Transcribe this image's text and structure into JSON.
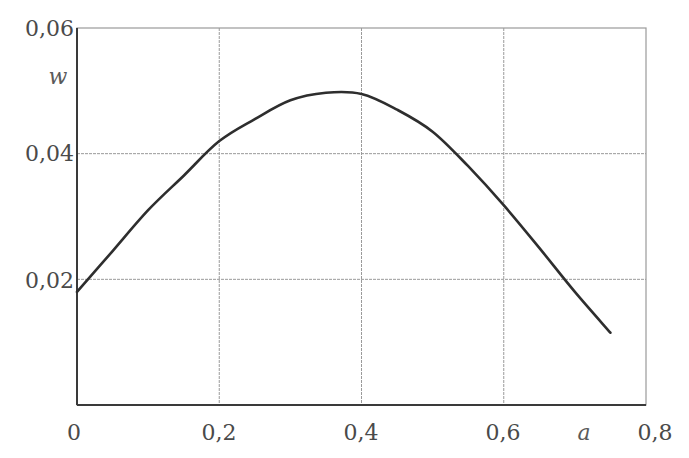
{
  "chart_data": {
    "type": "line",
    "title": "",
    "xlabel": "a",
    "ylabel": "w",
    "xlim": [
      0,
      0.8
    ],
    "ylim": [
      0,
      0.06
    ],
    "grid": true,
    "legend": null,
    "x_ticks": [
      "0",
      "0,2",
      "0,4",
      "0,6",
      "0,8"
    ],
    "x_tick_values": [
      0,
      0.2,
      0.4,
      0.6,
      0.8
    ],
    "y_ticks": [
      "0,02",
      "0,04",
      "0,06"
    ],
    "y_tick_values": [
      0.02,
      0.04,
      0.06
    ],
    "series": [
      {
        "name": "w(a)",
        "x": [
          0,
          0.05,
          0.1,
          0.15,
          0.2,
          0.25,
          0.3,
          0.35,
          0.4,
          0.45,
          0.5,
          0.55,
          0.6,
          0.65,
          0.7,
          0.75
        ],
        "values": [
          0.018,
          0.0245,
          0.031,
          0.0365,
          0.042,
          0.0455,
          0.0485,
          0.0497,
          0.0495,
          0.047,
          0.0435,
          0.038,
          0.0318,
          0.025,
          0.018,
          0.0115
        ]
      }
    ]
  },
  "labels": {
    "x_axis": "a",
    "y_axis": "w",
    "x_ticks": [
      "0",
      "0,2",
      "0,4",
      "0,6",
      "0,8"
    ],
    "y_ticks": [
      "0,06",
      "0,04",
      "0,02"
    ]
  },
  "colors": {
    "curve": "#2e2e2e",
    "axis": "#3a3a3a",
    "grid": "#9a9a9a",
    "text": "#4a4a4a"
  }
}
